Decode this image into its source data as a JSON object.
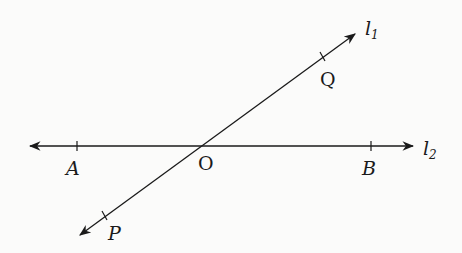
{
  "diagram": {
    "type": "intersecting-lines",
    "lines": [
      {
        "name": "l",
        "subscript": "1",
        "label": "l1",
        "from": [
          78,
          236
        ],
        "to": [
          357,
          33
        ]
      },
      {
        "name": "l",
        "subscript": "2",
        "label": "l2",
        "from": [
          28,
          146
        ],
        "to": [
          415,
          146
        ]
      }
    ],
    "intersection": {
      "label": "O",
      "point": [
        200,
        146
      ]
    },
    "points": [
      {
        "label": "A",
        "on": "l2",
        "point": [
          77,
          146
        ]
      },
      {
        "label": "B",
        "on": "l2",
        "point": [
          371,
          146
        ]
      },
      {
        "label": "Q",
        "on": "l1",
        "point": [
          323,
          57
        ]
      },
      {
        "label": "P",
        "on": "l1",
        "point": [
          105,
          216
        ]
      }
    ],
    "colors": {
      "line": "#1a1a1a",
      "background": "#fbfbfa"
    }
  }
}
